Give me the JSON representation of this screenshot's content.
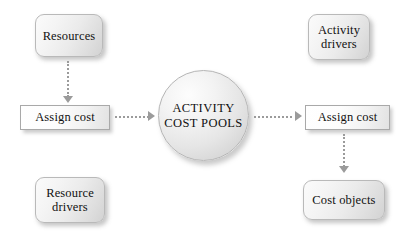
{
  "diagram": {
    "background_color": "#ffffff",
    "accent_color": "#9b9b9b",
    "box_fill_color": "#eeeeee",
    "text_color": "#111111"
  },
  "nodes": {
    "resources": {
      "label": "Resources",
      "shape": "rounded-rectangle"
    },
    "activity_drivers": {
      "line1": "Activity",
      "line2": "drivers",
      "shape": "rounded-rectangle"
    },
    "resource_drivers": {
      "line1": "Resource",
      "line2": "drivers",
      "shape": "rounded-rectangle"
    },
    "cost_objects": {
      "label": "Cost objects",
      "shape": "rounded-rectangle"
    },
    "assign_cost_left": {
      "label": "Assign cost",
      "shape": "rectangle"
    },
    "assign_cost_right": {
      "label": "Assign cost",
      "shape": "rectangle"
    },
    "activity_cost_pools": {
      "line1": "ACTIVITY",
      "line2": "COST POOLS",
      "shape": "circle"
    }
  },
  "connectors": [
    {
      "name": "resources-to-assign-cost",
      "from": "resources",
      "to": "assign_cost_left",
      "style": "dotted",
      "direction": "down"
    },
    {
      "name": "assign-cost-to-pools",
      "from": "assign_cost_left",
      "to": "activity_cost_pools",
      "style": "dotted",
      "direction": "right"
    },
    {
      "name": "pools-to-assign-cost",
      "from": "activity_cost_pools",
      "to": "assign_cost_right",
      "style": "dotted",
      "direction": "right"
    },
    {
      "name": "assign-cost-to-cost-objects",
      "from": "assign_cost_right",
      "to": "cost_objects",
      "style": "dotted",
      "direction": "down"
    }
  ]
}
